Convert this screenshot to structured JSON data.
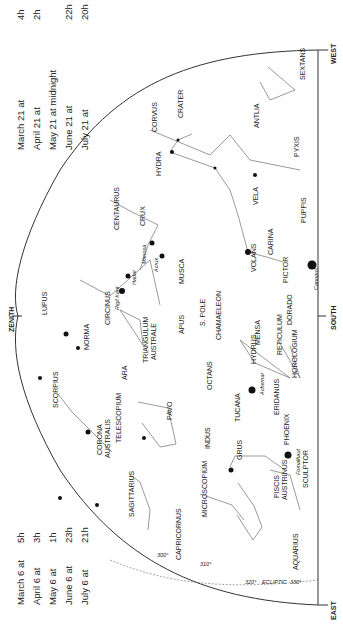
{
  "title_orientation": "rotated 90deg clockwise",
  "times_top": [
    {
      "date": "March 21 at",
      "time": "4h"
    },
    {
      "date": "April 21 at",
      "time": "2h"
    },
    {
      "date": "May 21 at midnight",
      "time": ""
    },
    {
      "date": "June 21 at",
      "time": "22h"
    },
    {
      "date": "July 21 at",
      "time": "20h"
    }
  ],
  "times_bottom": [
    {
      "date": "March 6 at",
      "time": "5h"
    },
    {
      "date": "April 6 at",
      "time": "3h"
    },
    {
      "date": "May 6 at",
      "time": "1h"
    },
    {
      "date": "June 6 at",
      "time": "23h"
    },
    {
      "date": "July 6 at",
      "time": "21h"
    }
  ],
  "directions": {
    "zenith": "ZENITH",
    "south": "SOUTH",
    "east": "EAST",
    "west": "WEST"
  },
  "constellations": {
    "sextans": "SEXTANS",
    "corvus": "CORVUS",
    "crater": "CRATER",
    "hydra": "HYDRA",
    "antlia": "ANTLIA",
    "pyxis": "PYXIS",
    "vela": "VELA",
    "puppis": "PUPPIS",
    "centaurus": "CENTAURUS",
    "crux": "CRUX",
    "musca": "MUSCA",
    "carina": "CARINA",
    "volans": "VOLANS",
    "pictor": "PICTOR",
    "lupus": "LUPUS",
    "circinus": "CIRCINUS",
    "chamaeleon": "CHAMAELEON",
    "mensa": "MENSA",
    "dorado": "DORADO",
    "norma": "NORMA",
    "triangulum_australe": [
      "TRIANGULUM",
      "AUSTRALE"
    ],
    "apus": "APUS",
    "s_pole": "S. POLE",
    "octans": "OCTANS",
    "hydrus": "HYDRUS",
    "reticulum": "RETICULUM",
    "horologium": "HOROLOGIUM",
    "scorpius": "SCORPIUS",
    "ara": "ARA",
    "pavo": "PAVO",
    "tucana": "TUCANA",
    "eridanus": "ERIDANUS",
    "corona_australis": [
      "CORONA",
      "AUSTRALIS"
    ],
    "telescopium": "TELESCOPIUM",
    "indus": "INDUS",
    "phoenix": "PHOENIX",
    "sagittarius": "SAGITTARIUS",
    "microscopium": "MICROSCOPIUM",
    "grus": "GRUS",
    "piscis_austrinus": [
      "PISCIS",
      "AUSTRINUS"
    ],
    "sculptor": "SCULPTOR",
    "capricornus": "CAPRICORNUS",
    "aquarius": "AQUARIUS"
  },
  "stars": {
    "rigil_kent": "Rigil Kent",
    "hadar": "Hadar",
    "mimosa": "Mimosa",
    "acrux": "Acrux",
    "canopus": "Canopus",
    "achernar": "Achernar",
    "fomalhaut": "Fomalhaut"
  },
  "ecliptic": {
    "label": "ECLIPTIC",
    "marks": [
      "300°",
      "310°",
      "320°",
      "330°"
    ]
  }
}
